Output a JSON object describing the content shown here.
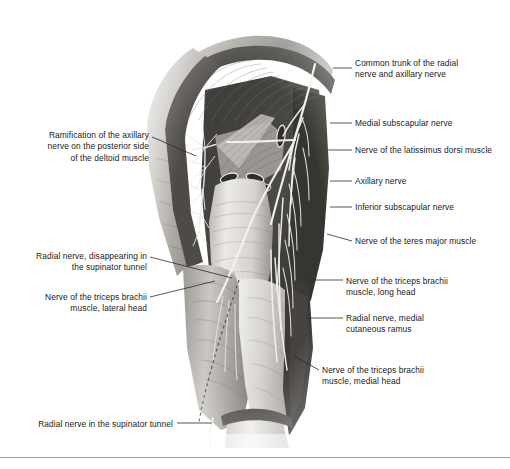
{
  "figure": {
    "orientation": "posterior view, right upper limb",
    "style": "grayscale halftone anatomical illustration"
  },
  "labels_right": [
    {
      "name": "common-trunk-radial-axillary-nerve",
      "text": "Common trunk of the radial\nnerve and axillary nerve",
      "x": 355,
      "y": 58,
      "leader": {
        "x1": 333,
        "y1": 68,
        "x2": 352,
        "y2": 68
      }
    },
    {
      "name": "medial-subscapular-nerve",
      "text": "Medial subscapular nerve",
      "x": 355,
      "y": 118,
      "leader": {
        "x1": 330,
        "y1": 123,
        "x2": 352,
        "y2": 123
      }
    },
    {
      "name": "nerve-latissimus-dorsi-muscle",
      "text": "Nerve of the latissimus dorsi muscle",
      "x": 355,
      "y": 145,
      "leader": {
        "x1": 328,
        "y1": 150,
        "x2": 352,
        "y2": 150
      }
    },
    {
      "name": "axillary-nerve",
      "text": "Axillary nerve",
      "x": 355,
      "y": 176,
      "leader": {
        "x1": 330,
        "y1": 181,
        "x2": 352,
        "y2": 181
      }
    },
    {
      "name": "inferior-subscapular-nerve",
      "text": "Inferior subscapular nerve",
      "x": 355,
      "y": 202,
      "leader": {
        "x1": 330,
        "y1": 207,
        "x2": 352,
        "y2": 207
      }
    },
    {
      "name": "nerve-teres-major-muscle",
      "text": "Nerve of the teres major muscle",
      "x": 355,
      "y": 236,
      "leader": {
        "x1": 327,
        "y1": 234,
        "x2": 352,
        "y2": 241
      }
    },
    {
      "name": "nerve-triceps-brachii-long-head",
      "text": "Nerve of the triceps brachii\nmuscle, long head",
      "x": 346,
      "y": 276,
      "leader": {
        "x1": 306,
        "y1": 280,
        "x2": 343,
        "y2": 280
      }
    },
    {
      "name": "radial-nerve-medial-cutaneous-ramus",
      "text": "Radial nerve, medial\ncutaneous ramus",
      "x": 346,
      "y": 313,
      "leader": {
        "x1": 306,
        "y1": 318,
        "x2": 343,
        "y2": 318
      }
    },
    {
      "name": "nerve-triceps-brachii-medial-head",
      "text": "Nerve of the triceps brachii\nmuscle, medial head",
      "x": 322,
      "y": 365,
      "leader": {
        "x1": 294,
        "y1": 356,
        "x2": 319,
        "y2": 370
      }
    }
  ],
  "labels_left": [
    {
      "name": "ramification-axillary-nerve-deltoid",
      "text": "Ramification of the axillary\nnerve on the posterior side\nof the deltoid muscle",
      "right_x": 149,
      "y": 130,
      "leader": {
        "x1": 152,
        "y1": 137,
        "x2": 196,
        "y2": 156
      }
    },
    {
      "name": "radial-nerve-disappearing-supinator-tunnel",
      "text": "Radial nerve, disappearing in\nthe supinator tunnel",
      "right_x": 147,
      "y": 251,
      "leader": {
        "x1": 150,
        "y1": 257,
        "x2": 232,
        "y2": 278
      }
    },
    {
      "name": "nerve-triceps-brachii-lateral-head",
      "text": "Nerve of the triceps brachii\nmuscle, lateral head",
      "right_x": 147,
      "y": 292,
      "leader": {
        "x1": 150,
        "y1": 297,
        "x2": 215,
        "y2": 281
      }
    },
    {
      "name": "radial-nerve-in-supinator-tunnel",
      "text": "Radial nerve in the supinator tunnel",
      "right_x": 173,
      "y": 419,
      "leader": {
        "x1": 177,
        "y1": 423,
        "x2": 212,
        "y2": 423
      }
    }
  ],
  "colors": {
    "background": "#ffffff",
    "text": "#1a1a1a",
    "leader_line": "#2b2b2b",
    "footer_rule": "#9a9a9a",
    "muscle_light": "#e7e5e1",
    "muscle_mid": "#b4b1ac",
    "muscle_dark": "#6f6c68",
    "cavity_dark": "#3a3835",
    "nerve": "#f2f0ec"
  },
  "footer": {
    "rule_visible": true,
    "bleed_text": ""
  }
}
